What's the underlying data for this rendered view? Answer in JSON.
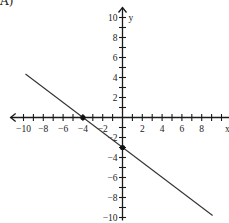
{
  "problem": {
    "label": "A)"
  },
  "chart_data": {
    "type": "line",
    "title": "",
    "xlabel": "x",
    "ylabel": "y",
    "xlim": [
      -10,
      10
    ],
    "ylim": [
      -10,
      10
    ],
    "x_ticks": [
      -10,
      -8,
      -6,
      -4,
      -2,
      2,
      4,
      6,
      8
    ],
    "y_ticks": [
      10,
      8,
      6,
      4,
      2,
      -2,
      -4,
      -6,
      -8,
      -10
    ],
    "grid": false,
    "legend": null,
    "series": [
      {
        "name": "line",
        "equation": "y = -3/4 x - 3",
        "slope": -0.75,
        "intercept": -3,
        "x": [
          -9.8,
          9.1
        ],
        "y": [
          4.35,
          -9.8
        ]
      }
    ],
    "points": [
      {
        "x": -4,
        "y": 0
      },
      {
        "x": 0,
        "y": -3
      }
    ]
  }
}
